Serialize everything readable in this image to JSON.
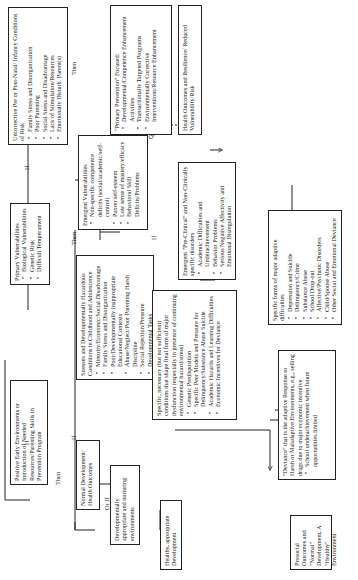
{
  "diagram": {
    "orientation": "rotated 90 degrees counter-clockwise",
    "boxes": {
      "positive_early": {
        "title": "Positive Early Environments or Introduction of Needed Resources/Parenting Skills in Prevention Program"
      },
      "normal_dev": {
        "title": "Normal Development/ Health Outcomes"
      },
      "dev_appropriate": {
        "title": "Developmentally appropriate and nurturing environments"
      },
      "healthy_dev": {
        "title": "Healthy, appropriate Development"
      },
      "prosocial": {
        "title": "Prosocial Outcomes and \"Normal\" Development, A \"Healthy\" Environment"
      },
      "uncorrective": {
        "title": "Uncorrective Pre or Post-Natal/ Infancy Conditions of Risk",
        "items": [
          "Family Stress and Disorganization",
          "Poor Parenting",
          "Social Stress and Disadvantage",
          "Lack of Stimulation/Resources",
          "Emotionally Disturb. Parent(s)"
        ]
      },
      "primary_vuln": {
        "title": "Primary Vulnerabilities",
        "items": [
          "Biological Vulnerabilities",
          "Genetic Risk",
          "Difficult Temperament"
        ]
      },
      "stresses": {
        "title": "Stresses and Developmentally Hazardous Conditions in Childhood and Adolescence",
        "items": [
          "Minority/Economic/Social Disadvantage",
          "Family Stress and Disorganization",
          "Poor/Developmentally Inappropriate Educational Contexts",
          "Abuse/Neglect/Poor Parenting Harsh Discipline",
          "Social Rejection/Pressure",
          "Developmental Tasks"
        ]
      },
      "emergent_vuln": {
        "title": "Emergent Vulnerabilities",
        "items": [
          "Non-specific competence deficits (social/academic/self-control)",
          "Poorer self-esteem",
          "Low sense of mastery/efficacy",
          "Behavioral Skill Deficits/Problems"
        ]
      },
      "primary_prevention": {
        "title": "\"Primary Prevention\" Focused:",
        "items": [
          "Developmental/Competence Enhancement Activities",
          "Transactionally Targeted Programs",
          "Environmentally Corrective Interventions/Resource Enhancement"
        ]
      },
      "health_outcomes": {
        "title": "Health Outcomes and Resilience/ Reduced Vulnerability/Risk"
      },
      "specific_necessary": {
        "title": "Specific, necessary (but not sufficient) conditions that shape final form of major dysfunction (especially in presence of continuing environmental hazard/stress)",
        "items": [
          "Genetic Predisposition",
          "Specific Peer Models and Pressure for Delinquency/Substance Abuse Suicide",
          "Academic Hazards and Learning Difficulties",
          "Economic Incentives for Deviance"
        ]
      },
      "pre_clinical": {
        "title": "Emergent \"Pre-Clinical\" and Non-Clinically specific disorders",
        "items": [
          "Academic Difficulties and Underachievement",
          "Behavior Problems",
          "Serious Negative Affectivity and Emotional Disregulation"
        ]
      },
      "specific_forms": {
        "title": "Specific forms of major adaptive difficulties",
        "items": [
          "Depression and Suicide",
          "Delinquency/Crime",
          "Substance Abuse",
          "School Drop-out",
          "Affective/Psychotic Disorders",
          "Child/Spouse Abuse",
          "Other Social and Emotional Deviance"
        ]
      },
      "deviance": {
        "title": "\"Deviance\" that is the adaptive Response to Harsh or Maladaptive Environments, e.g., selling drugs due to major economic incentive",
        "items": [
          "School underachievement when future opportunities limited"
        ]
      }
    },
    "labels": {
      "if": "If",
      "then": "Then",
      "or_if": "Or If"
    }
  }
}
